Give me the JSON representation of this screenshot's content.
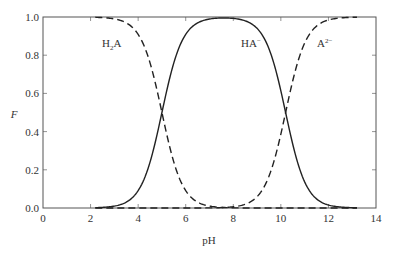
{
  "chart_data": {
    "type": "line",
    "title": "",
    "xlabel": "pH",
    "ylabel": "F",
    "xlim": [
      0,
      14
    ],
    "ylim": [
      0.0,
      1.0
    ],
    "xticks": [
      0,
      2,
      4,
      6,
      8,
      10,
      12,
      14
    ],
    "yticks": [
      0.0,
      0.2,
      0.4,
      0.6,
      0.8,
      1.0
    ],
    "xtick_labels": [
      "0",
      "2",
      "4",
      "6",
      "8",
      "10",
      "12",
      "14"
    ],
    "ytick_labels": [
      "0.0",
      "0.2",
      "0.4",
      "0.6",
      "0.8",
      "1.0"
    ],
    "grid": false,
    "legend": "none (inline labels)",
    "model": {
      "description": "Diprotic acid H2A fractional composition",
      "pKa1": 5.0,
      "pKa2": 10.2,
      "pH_range": [
        2.2,
        13.2
      ]
    },
    "series": [
      {
        "name": "H2A",
        "label_main": "H",
        "label_sub": "2",
        "label_tail": "A",
        "style": "dashed",
        "x": [
          2.2,
          3.0,
          4.0,
          4.5,
          5.0,
          5.5,
          6.0,
          7.0,
          7.6,
          8.0,
          9.0,
          10.0,
          11.0,
          12.0,
          13.2
        ],
        "values": [
          1.0,
          0.99,
          0.91,
          0.76,
          0.5,
          0.24,
          0.09,
          0.01,
          0.0,
          0.0,
          0.0,
          0.0,
          0.0,
          0.0,
          0.0
        ]
      },
      {
        "name": "HA-",
        "label_main": "HA",
        "label_sup": "−",
        "style": "solid",
        "x": [
          2.2,
          3.0,
          4.0,
          4.5,
          5.0,
          5.5,
          6.0,
          7.0,
          7.6,
          8.0,
          9.0,
          9.7,
          10.2,
          10.7,
          11.0,
          12.0,
          13.2
        ],
        "values": [
          0.0,
          0.01,
          0.09,
          0.24,
          0.5,
          0.76,
          0.91,
          0.99,
          1.0,
          0.99,
          0.94,
          0.76,
          0.5,
          0.24,
          0.14,
          0.02,
          0.0
        ]
      },
      {
        "name": "A2-",
        "label_main": "A",
        "label_sup": "2−",
        "style": "dashed",
        "x": [
          2.2,
          7.6,
          8.0,
          9.0,
          9.7,
          10.2,
          10.7,
          11.0,
          12.0,
          13.2
        ],
        "values": [
          0.0,
          0.0,
          0.01,
          0.06,
          0.24,
          0.5,
          0.76,
          0.86,
          0.98,
          1.0
        ]
      }
    ]
  }
}
